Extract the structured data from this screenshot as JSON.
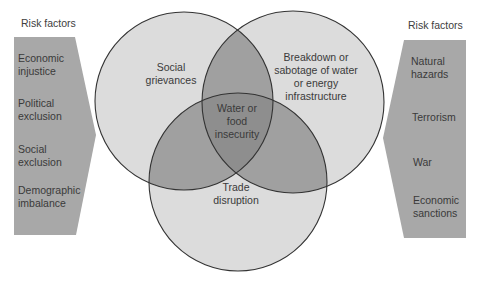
{
  "left_panel": {
    "title": "Risk factors",
    "items": [
      "Economic injustice",
      "Political exclusion",
      "Social exclusion",
      "Demographic imbalance"
    ],
    "lines": [
      [
        "Economic",
        "injustice"
      ],
      [
        "Political",
        "exclusion"
      ],
      [
        "Social",
        "exclusion"
      ],
      [
        "Demographic",
        "imbalance"
      ]
    ]
  },
  "right_panel": {
    "title": "Risk factors",
    "items": [
      "Natural hazards",
      "Terrorism",
      "War",
      "Economic sanctions"
    ],
    "lines": [
      [
        "Natural",
        "hazards"
      ],
      [
        "Terrorism"
      ],
      [
        "War"
      ],
      [
        "Economic",
        "sanctions"
      ]
    ]
  },
  "venn": {
    "circles": [
      {
        "label": "Social grievances",
        "lines": [
          "Social",
          "grievances"
        ]
      },
      {
        "label": "Breakdown or sabotage of water or energy infrastructure",
        "lines": [
          "Breakdown or",
          "sabotage of water",
          "or energy",
          "infrastructure"
        ]
      },
      {
        "label": "Trade disruption",
        "lines": [
          "Trade",
          "disruption"
        ]
      }
    ],
    "center": {
      "label": "Water or food insecurity",
      "lines": [
        "Water or",
        "food",
        "insecurity"
      ]
    }
  },
  "colors": {
    "panel": "#a8a8a8",
    "circle_fill": "#dcdcdc",
    "overlap_fill": "#a0a0a0",
    "center_fill": "#8e8e8e",
    "stroke": "#333333",
    "text": "#3a3a3a"
  }
}
